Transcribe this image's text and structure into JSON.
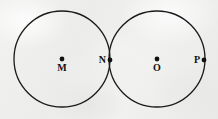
{
  "figure": {
    "canvas": {
      "width": 218,
      "height": 119
    },
    "background_color": "#efefee",
    "stroke_color": "#1a1a1a",
    "stroke_width": 1.3,
    "point_color": "#111111",
    "point_radius": 2.4
  },
  "circles": [
    {
      "id": "left-circle",
      "name": "circle-m",
      "cx": 62,
      "cy": 59,
      "r": 48
    },
    {
      "id": "right-circle",
      "name": "circle-o",
      "cx": 157,
      "cy": 59,
      "r": 48
    }
  ],
  "points": [
    {
      "id": "M",
      "label": "M",
      "x": 62,
      "y": 59,
      "label_x": 62,
      "label_y": 63,
      "label_pos": "below",
      "role": "center-of-left-circle"
    },
    {
      "id": "N",
      "label": "N",
      "x": 110,
      "y": 60,
      "label_x": 106,
      "label_y": 60,
      "label_pos": "left",
      "role": "tangency-point"
    },
    {
      "id": "O",
      "label": "O",
      "x": 157,
      "y": 59,
      "label_x": 157,
      "label_y": 63,
      "label_pos": "below",
      "role": "center-of-right-circle"
    },
    {
      "id": "P",
      "label": "P",
      "x": 204,
      "y": 60,
      "label_x": 200,
      "label_y": 60,
      "label_pos": "left",
      "role": "point-on-right-circle"
    }
  ]
}
